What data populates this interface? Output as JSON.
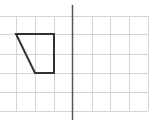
{
  "diagram": {
    "type": "grid-reflection",
    "grid": {
      "color": "#d4d4d4",
      "vertical_lines_x": [
        16,
        35,
        54,
        92,
        110,
        129,
        148
      ],
      "horizontal_lines_y": [
        16,
        34,
        54,
        73,
        92,
        111
      ],
      "x_min": 0,
      "x_max": 148,
      "y_min": 16,
      "y_max": 111
    },
    "mirror_axis": {
      "x": 72.5,
      "y1": 5,
      "y2": 120,
      "color": "#555555"
    },
    "shape": {
      "name": "trapezoid",
      "color": "#333333",
      "points": "16,34 54,34 54,73 35,73"
    }
  }
}
